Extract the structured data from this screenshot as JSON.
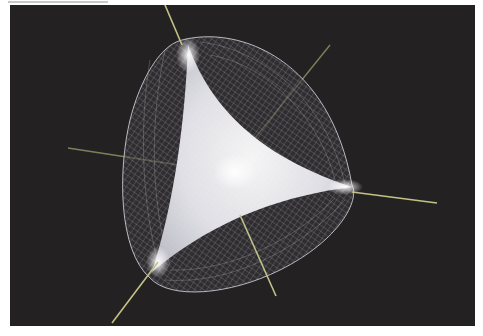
{
  "figure": {
    "background_color": "#242123",
    "axis_color": "#b8b67a",
    "mesh_color": "#d8d8e0",
    "core_color": "#f2f2f6",
    "axes": [
      {
        "name": "axis-1",
        "from": [
          165,
          0
        ],
        "to": [
          178,
          40
        ]
      },
      {
        "name": "axis-2",
        "from": [
          330,
          45
        ],
        "to": [
          255,
          138
        ]
      },
      {
        "name": "axis-3",
        "from": [
          68,
          148
        ],
        "to": [
          185,
          166
        ]
      },
      {
        "name": "axis-4",
        "from": [
          355,
          192
        ],
        "to": [
          437,
          203
        ]
      },
      {
        "name": "axis-5",
        "from": [
          240,
          215
        ],
        "to": [
          276,
          296
        ]
      },
      {
        "name": "axis-6",
        "from": [
          155,
          260
        ],
        "to": [
          112,
          323
        ]
      }
    ]
  }
}
